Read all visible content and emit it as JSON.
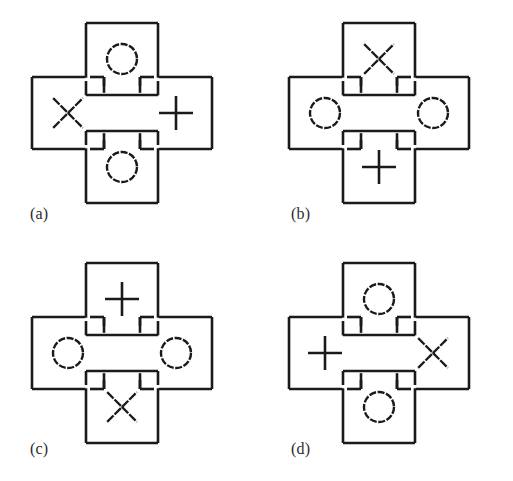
{
  "figure": {
    "background_color": "#ffffff",
    "stroke_color": "#1a1a1a",
    "symbol_color": "#1a1a1a",
    "panel_count": 4
  },
  "panels": [
    {
      "label": "(a)",
      "symbols": {
        "top": "O",
        "left": "X",
        "right": "+",
        "bottom": "O"
      }
    },
    {
      "label": "(b)",
      "symbols": {
        "top": "X",
        "left": "O",
        "right": "O",
        "bottom": "+"
      }
    },
    {
      "label": "(c)",
      "symbols": {
        "top": "+",
        "left": "O",
        "right": "O",
        "bottom": "X"
      }
    },
    {
      "label": "(d)",
      "symbols": {
        "top": "O",
        "left": "+",
        "right": "X",
        "bottom": "O"
      }
    }
  ],
  "symbol_legend": {
    "O": "circle-symbol",
    "X": "cross-diagonal-symbol",
    "+": "plus-symbol"
  }
}
